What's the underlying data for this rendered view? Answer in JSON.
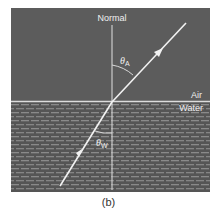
{
  "figure": {
    "labels": {
      "normal": "Normal",
      "air": "Air",
      "water": "Water",
      "theta_air": "θ",
      "theta_air_sub": "A",
      "theta_water": "θ",
      "theta_water_sub": "W"
    },
    "caption": "(b)",
    "colors": {
      "air_bg": "#5c5c5c",
      "water_bg": "#555555",
      "water_dash": "#8a8a8a",
      "line": "#e8e8e8",
      "text": "#f0f0f0"
    }
  }
}
